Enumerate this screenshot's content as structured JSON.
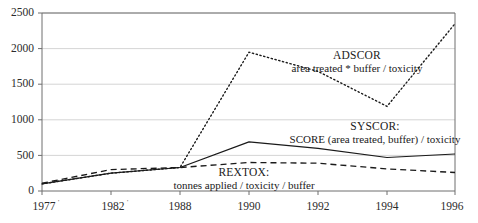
{
  "chart_data": {
    "type": "line",
    "title": "",
    "subtitle": "",
    "xlabel": "",
    "ylabel": "",
    "x": [
      "1977",
      "1982",
      "1988",
      "1990",
      "1992",
      "1994",
      "1996"
    ],
    "categories": [
      "1977",
      "1982",
      "1988",
      "1990",
      "1992",
      "1994",
      "1996"
    ],
    "xtick_labels": [
      "1977",
      "1982",
      "1988",
      "1990",
      "1992",
      "1994",
      "1996"
    ],
    "xtick_marks": [
      "'",
      "'",
      "",
      "",
      "",
      "",
      ""
    ],
    "ytick_labels": [
      "0",
      "500",
      "1000",
      "1500",
      "2000",
      "2500"
    ],
    "ytick_values": [
      0,
      500,
      1000,
      1500,
      2000,
      2500
    ],
    "ylim": [
      0,
      2500
    ],
    "grid": "horizontal",
    "legend_position": "inline-annotations",
    "series": [
      {
        "name": "ADSCOR",
        "label": "ADSCOR",
        "definition": "area treated * buffer / toxicity",
        "style": "dotted",
        "color": "#1a1a1a",
        "values": [
          100,
          250,
          330,
          1950,
          1680,
          1190,
          2350
        ]
      },
      {
        "name": "SYSCOR",
        "label": "SYSCOR:",
        "definition": "SCORE (area treated, buffer) / toxicity",
        "style": "solid",
        "color": "#1a1a1a",
        "values": [
          100,
          250,
          330,
          690,
          600,
          470,
          520
        ]
      },
      {
        "name": "REXTOX",
        "label": "REXTOX:",
        "definition": "tonnes applied / toxicity / buffer",
        "style": "dashed",
        "color": "#1a1a1a",
        "values": [
          110,
          300,
          330,
          400,
          390,
          310,
          260
        ]
      }
    ],
    "annotations": [
      {
        "title": "ADSCOR",
        "subtitle": "area treated * buffer / toxicity"
      },
      {
        "title": "SYSCOR:",
        "subtitle": "SCORE (area treated, buffer) / toxicity"
      },
      {
        "title": "REXTOX:",
        "subtitle": "tonnes applied / toxicity / buffer"
      }
    ],
    "colors": {
      "axis": "#6e6e6e",
      "grid": "#c9c9c9",
      "line": "#1a1a1a",
      "text": "#1a1a1a",
      "background": "#ffffff"
    }
  }
}
